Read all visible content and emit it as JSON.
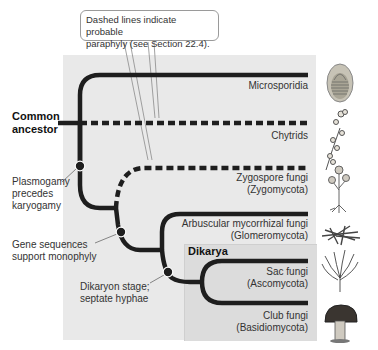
{
  "callout": {
    "line1": "Dashed lines indicate probable",
    "line2": "paraphyly (see Section 22.4)."
  },
  "root": {
    "line1": "Common",
    "line2": "ancestor"
  },
  "group": {
    "title": "Dikarya"
  },
  "taxa": [
    {
      "name": "Microsporidia",
      "sub": "",
      "line": "solid"
    },
    {
      "name": "Chytrids",
      "sub": "",
      "line": "dashed"
    },
    {
      "name": "Zygospore fungi",
      "sub": "(Zygomycota)",
      "line": "dashed"
    },
    {
      "name": "Arbuscular mycorrhizal fungi",
      "sub": "(Glomeromycota)",
      "line": "solid"
    },
    {
      "name": "Sac fungi",
      "sub": "(Ascomycota)",
      "line": "solid"
    },
    {
      "name": "Club fungi",
      "sub": "(Basidiomycota)",
      "line": "solid"
    }
  ],
  "nodes": [
    {
      "line1": "Plasmogamy",
      "line2": "precedes",
      "line3": "karyogamy"
    },
    {
      "line1": "Gene sequences",
      "line2": "support monophyly"
    },
    {
      "line1": "Dikaryon stage;",
      "line2": "septate hyphae"
    }
  ],
  "illustrations": [
    "microsporidia-spore-icon",
    "chytrid-icon",
    "zygospore-fungus-icon",
    "mycorrhizal-fungus-icon",
    "sac-fungus-icon",
    "mushroom-icon"
  ],
  "colors": {
    "panel": "#e9e9e9",
    "dikarya_panel": "#dcdcdc",
    "branch": "#1e1e1e"
  }
}
